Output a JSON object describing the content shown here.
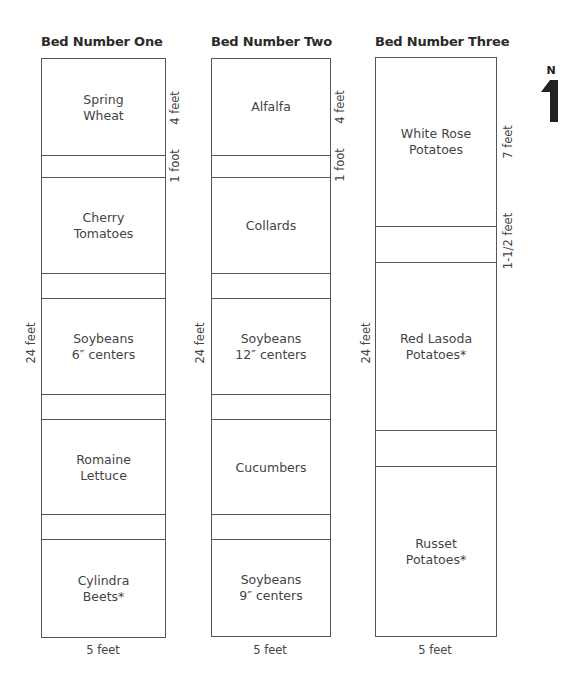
{
  "beds": [
    {
      "title": "Bed Number One",
      "width_label": "5 feet",
      "length_label": "24 feet",
      "right_labels": [
        "4 feet",
        "1 foot"
      ],
      "crops": [
        {
          "line1": "Spring",
          "line2": "Wheat"
        },
        {
          "line1": "Cherry",
          "line2": "Tomatoes"
        },
        {
          "line1": "Soybeans",
          "line2": "6″ centers"
        },
        {
          "line1": "Romaine",
          "line2": "Lettuce"
        },
        {
          "line1": "Cylindra",
          "line2": "Beets*"
        }
      ]
    },
    {
      "title": "Bed Number Two",
      "width_label": "5 feet",
      "length_label": "24 feet",
      "right_labels": [
        "4 feet",
        "1 foot"
      ],
      "crops": [
        {
          "line1": "Alfalfa",
          "line2": ""
        },
        {
          "line1": "Collards",
          "line2": ""
        },
        {
          "line1": "Soybeans",
          "line2": "12″ centers"
        },
        {
          "line1": "Cucumbers",
          "line2": ""
        },
        {
          "line1": "Soybeans",
          "line2": "9″ centers"
        }
      ]
    },
    {
      "title": "Bed Number Three",
      "width_label": "5 feet",
      "length_label": "24 feet",
      "right_labels": [
        "7 feet",
        "1-1/2 feet"
      ],
      "crops": [
        {
          "line1": "White Rose",
          "line2": "Potatoes"
        },
        {
          "line1": "Red Lasoda",
          "line2": "Potatoes*"
        },
        {
          "line1": "Russet",
          "line2": "Potatoes*"
        }
      ]
    }
  ],
  "north_arrow": {
    "label": "N",
    "icon": "north-arrow-icon"
  },
  "colors": {
    "line": "#555555",
    "text": "#444444",
    "title": "#2a2a2a"
  }
}
